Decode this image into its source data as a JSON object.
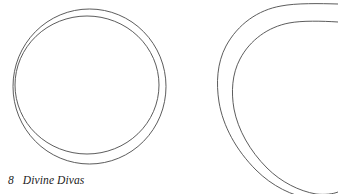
{
  "page": {
    "background_color": "#ffffff",
    "width": 338,
    "height": 194
  },
  "footer": {
    "page_number": "8",
    "book_title": "Divine Divas"
  },
  "figures": {
    "stroke_color": "#4a4a4a",
    "fill": "none",
    "items": [
      {
        "name": "circle-pattern",
        "description": "Two nested circle outlines, slightly offset",
        "outer_label": "outer circle outline",
        "inner_label": "inner circle outline"
      },
      {
        "name": "rounded-triangle-pattern",
        "description": "Two nested rounded-triangle outlines, cropped by the right and bottom page edges",
        "outer_label": "outer rounded-triangle outline",
        "inner_label": "inner rounded-triangle outline"
      }
    ]
  }
}
